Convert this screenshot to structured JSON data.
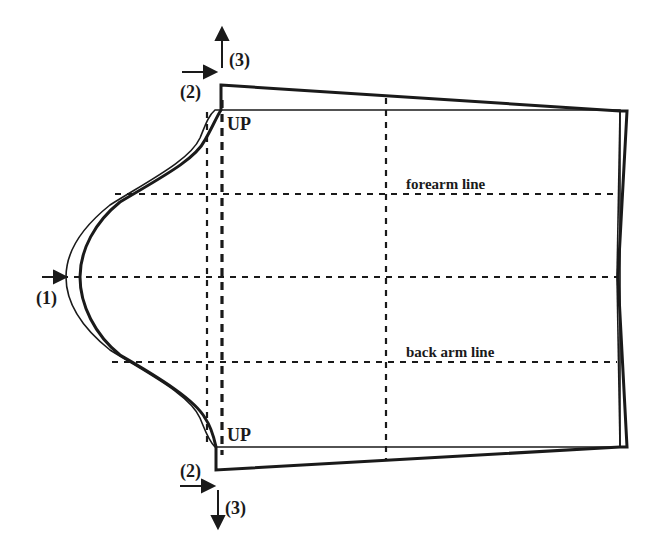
{
  "diagram": {
    "type": "sleeve-pattern-adjustment",
    "labels": {
      "forearm_line": "forearm line",
      "back_arm_line": "back arm line",
      "up_top": "UP",
      "up_bottom": "UP",
      "step1": "(1)",
      "step2_top": "(2)",
      "step2_bottom": "(2)",
      "step3_top": "(3)",
      "step3_bottom": "(3)"
    },
    "colors": {
      "ink": "#1a1a1a",
      "background": "#ffffff"
    },
    "lines": {
      "original_outline": "thin",
      "adjusted_outline": "bold",
      "guide_lines": "dashed"
    }
  }
}
